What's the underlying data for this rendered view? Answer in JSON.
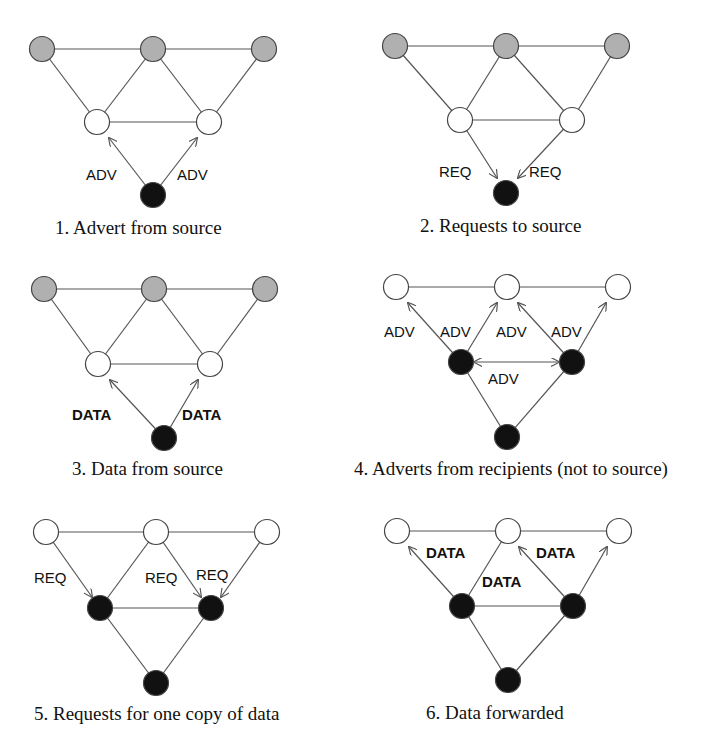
{
  "figure": {
    "colors": {
      "grey_node": "#b0b0b0",
      "white_node": "#ffffff",
      "black_node": "#111111",
      "edge": "#555555"
    },
    "panels": [
      {
        "id": 1,
        "caption": "1. Advert from source",
        "node_states": {
          "top_left": "grey",
          "top_mid": "grey",
          "top_right": "grey",
          "mid_left": "white",
          "mid_right": "white",
          "bottom": "black"
        },
        "messages": [
          {
            "label": "ADV",
            "from": "bottom",
            "to": "mid_left"
          },
          {
            "label": "ADV",
            "from": "bottom",
            "to": "mid_right"
          }
        ]
      },
      {
        "id": 2,
        "caption": "2. Requests to source",
        "node_states": {
          "top_left": "grey",
          "top_mid": "grey",
          "top_right": "grey",
          "mid_left": "white",
          "mid_right": "white",
          "bottom": "black"
        },
        "messages": [
          {
            "label": "REQ",
            "from": "mid_left",
            "to": "bottom"
          },
          {
            "label": "REQ",
            "from": "mid_right",
            "to": "bottom"
          }
        ]
      },
      {
        "id": 3,
        "caption": "3. Data from source",
        "node_states": {
          "top_left": "grey",
          "top_mid": "grey",
          "top_right": "grey",
          "mid_left": "white",
          "mid_right": "white",
          "bottom": "black"
        },
        "messages": [
          {
            "label": "DATA",
            "from": "bottom",
            "to": "mid_left"
          },
          {
            "label": "DATA",
            "from": "bottom",
            "to": "mid_right"
          }
        ]
      },
      {
        "id": 4,
        "caption": "4. Adverts from recipients (not to source)",
        "node_states": {
          "top_left": "white",
          "top_mid": "white",
          "top_right": "white",
          "mid_left": "black",
          "mid_right": "black",
          "bottom": "black"
        },
        "messages": [
          {
            "label": "ADV",
            "from": "mid_left",
            "to": "top_left"
          },
          {
            "label": "ADV",
            "from": "mid_left",
            "to": "top_mid"
          },
          {
            "label": "ADV",
            "from": "mid_right",
            "to": "top_mid"
          },
          {
            "label": "ADV",
            "from": "mid_right",
            "to": "top_right"
          },
          {
            "label": "ADV",
            "from": "mid_left",
            "to": "mid_right",
            "bidirectional": true
          }
        ]
      },
      {
        "id": 5,
        "caption": "5. Requests for one copy of data",
        "node_states": {
          "top_left": "white",
          "top_mid": "white",
          "top_right": "white",
          "mid_left": "black",
          "mid_right": "black",
          "bottom": "black"
        },
        "messages": [
          {
            "label": "REQ",
            "from": "top_left",
            "to": "mid_left"
          },
          {
            "label": "REQ",
            "from": "top_mid",
            "to": "mid_right"
          },
          {
            "label": "REQ",
            "from": "top_right",
            "to": "mid_right"
          }
        ]
      },
      {
        "id": 6,
        "caption": "6. Data forwarded",
        "node_states": {
          "top_left": "white",
          "top_mid": "white",
          "top_right": "white",
          "mid_left": "black",
          "mid_right": "black",
          "bottom": "black"
        },
        "messages": [
          {
            "label": "DATA",
            "from": "mid_left",
            "to": "top_left"
          },
          {
            "label": "DATA",
            "from": "mid_right",
            "to": "top_mid"
          },
          {
            "label": "DATA",
            "from": "mid_right",
            "to": "top_right"
          }
        ]
      }
    ],
    "labels": {
      "p1_l": "ADV",
      "p1_r": "ADV",
      "p2_l": "REQ",
      "p2_r": "REQ",
      "p3_l": "DATA",
      "p3_r": "DATA",
      "p4_a": "ADV",
      "p4_b": "ADV",
      "p4_c": "ADV",
      "p4_d": "ADV",
      "p4_e": "ADV",
      "p5_a": "REQ",
      "p5_b": "REQ",
      "p5_c": "REQ",
      "p6_a": "DATA",
      "p6_b": "DATA",
      "p6_c": "DATA"
    },
    "captions": {
      "p1": "1. Advert from source",
      "p2": "2. Requests to source",
      "p3": "3. Data from source",
      "p4": "4. Adverts from recipients (not to source)",
      "p5": "5. Requests for one copy of data",
      "p6": "6. Data forwarded"
    }
  }
}
